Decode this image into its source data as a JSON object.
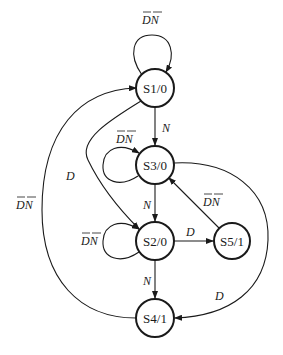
{
  "diagram": {
    "type": "state-machine",
    "states": [
      {
        "id": "S1",
        "label": "S1/0",
        "cx": 155,
        "cy": 88
      },
      {
        "id": "S3",
        "label": "S3/0",
        "cx": 155,
        "cy": 165
      },
      {
        "id": "S2",
        "label": "S2/0",
        "cx": 155,
        "cy": 241
      },
      {
        "id": "S5",
        "label": "S5/1",
        "cx": 232,
        "cy": 241
      },
      {
        "id": "S4",
        "label": "S4/1",
        "cx": 155,
        "cy": 318
      }
    ],
    "transitions": [
      {
        "from": "S1",
        "to": "S1",
        "label": "D̄N̄",
        "text": "DN",
        "negated": true
      },
      {
        "from": "S1",
        "to": "S3",
        "label": "N",
        "text": "N",
        "negated": false
      },
      {
        "from": "S1",
        "to": "S2",
        "label": "D",
        "text": "D",
        "negated": false
      },
      {
        "from": "S3",
        "to": "S3",
        "label": "D̄N̄",
        "text": "DN",
        "negated": true
      },
      {
        "from": "S3",
        "to": "S2",
        "label": "N",
        "text": "N",
        "negated": false
      },
      {
        "from": "S3",
        "to": "S4",
        "label": "D",
        "text": "D",
        "negated": false
      },
      {
        "from": "S2",
        "to": "S2",
        "label": "D̄N̄",
        "text": "DN",
        "negated": true
      },
      {
        "from": "S2",
        "to": "S5",
        "label": "D",
        "text": "D",
        "negated": false
      },
      {
        "from": "S2",
        "to": "S4",
        "label": "N",
        "text": "N",
        "negated": false
      },
      {
        "from": "S5",
        "to": "S3",
        "label": "D̄N̄",
        "text": "DN",
        "negated": true
      },
      {
        "from": "S4",
        "to": "S1",
        "label": "D̄N̄",
        "text": "DN",
        "negated": true
      }
    ]
  }
}
